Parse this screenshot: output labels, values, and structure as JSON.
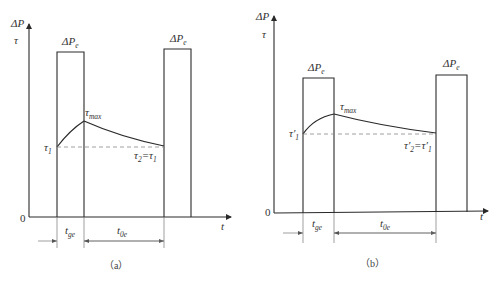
{
  "panels": [
    {
      "id": "a",
      "caption": "（a）",
      "y_axis_label_top": "ΔP",
      "y_axis_label_second": "τ",
      "x_axis_label": "t",
      "origin_label": "0",
      "pulse_label": "ΔP",
      "pulse_label_sub": "e",
      "tau_start": "τ",
      "tau_start_sub": "1",
      "tau_max": "τ",
      "tau_max_sub": "max",
      "tau_end": "τ",
      "tau_end_sub": "2",
      "tau_end_eq": "=τ",
      "tau_end_eq_sub": "1",
      "interval_1": "t",
      "interval_1_sub": "ge",
      "interval_2": "t",
      "interval_2_sub": "0e"
    },
    {
      "id": "b",
      "caption": "（b）",
      "y_axis_label_top": "ΔP",
      "y_axis_label_second": "τ",
      "x_axis_label": "t",
      "origin_label": "0",
      "pulse_label": "ΔP",
      "pulse_label_sub": "e",
      "tau_start": "τ′",
      "tau_start_sub": "1",
      "tau_max": "τ",
      "tau_max_sub": "max",
      "tau_end": "τ′",
      "tau_end_sub": "2",
      "tau_end_eq": "=τ′",
      "tau_end_eq_sub": "1",
      "interval_1": "t",
      "interval_1_sub": "ge",
      "interval_2": "t",
      "interval_2_sub": "0e"
    }
  ]
}
